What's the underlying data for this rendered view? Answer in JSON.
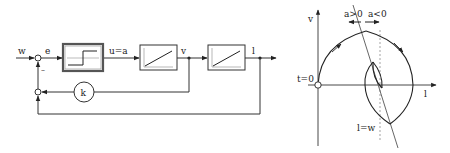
{
  "block_diagram": {
    "input_label": "w",
    "error_label": "e",
    "minus_sign": "–",
    "relay_output_label": "u=a",
    "integrator1_output_label": "v",
    "integrator2_output_label": "l",
    "gain_label": "k",
    "blocks": [
      {
        "id": "relay",
        "type": "relay-switch"
      },
      {
        "id": "integrator-1",
        "type": "ramp"
      },
      {
        "id": "integrator-2",
        "type": "ramp"
      }
    ]
  },
  "phase_plot": {
    "y_axis_label": "v",
    "x_axis_label": "l",
    "origin_label": "t=0",
    "switch_positive_label": "a>0",
    "switch_negative_label": "a<0",
    "target_label": "l=w"
  }
}
